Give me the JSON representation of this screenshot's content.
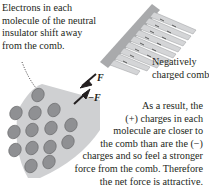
{
  "caption_left": {
    "lines": [
      "Electrons in each",
      "molecule of the neutral",
      "insulator shift away",
      "from the comb."
    ]
  },
  "comb_label": {
    "lines": [
      "Negatively",
      "charged comb"
    ]
  },
  "caption_right": {
    "lines": [
      "As a result, the",
      "(+) charges in each",
      "molecule are closer to",
      "the comb than are the (−)",
      "charges and so feel a stronger",
      "force from the comb. Therefore",
      "the net force is attractive."
    ]
  },
  "force_labels": {
    "on_comb": "F⃗",
    "on_insulator": "−F⃗"
  },
  "colors": {
    "insulator": "#cfd0d2",
    "molecule": "#8f9093",
    "comb": "#b7b8ba",
    "arrow": "#231f20"
  },
  "molecules": {
    "count": 15
  }
}
